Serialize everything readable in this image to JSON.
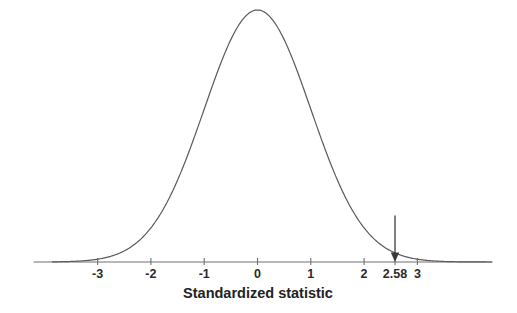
{
  "chart_data": {
    "type": "line",
    "title": "",
    "subtitle": "",
    "xlabel": "Standardized statistic",
    "ylabel": "",
    "xlim": [
      -3.85,
      4.4
    ],
    "ylim": [
      0,
      1.05
    ],
    "grid": false,
    "legend": null,
    "curve": {
      "name": "standard normal density",
      "distribution": "normal",
      "mean": 0,
      "sd": 1,
      "peak_x": 0,
      "peak_y": 1.0,
      "color": "#5a5a5a",
      "line_width": 1.2,
      "x": [
        -3.85,
        -3.5,
        -3.25,
        -3,
        -2.75,
        -2.5,
        -2.25,
        -2,
        -1.75,
        -1.5,
        -1.25,
        -1,
        -0.75,
        -0.5,
        -0.25,
        0,
        0.25,
        0.5,
        0.75,
        1,
        1.25,
        1.5,
        1.75,
        2,
        2.25,
        2.5,
        2.58,
        2.75,
        3,
        3.25,
        3.5,
        3.85,
        4.4
      ],
      "y": [
        0.0006,
        0.0022,
        0.0054,
        0.0111,
        0.0228,
        0.0439,
        0.0796,
        0.1353,
        0.2163,
        0.3247,
        0.4578,
        0.6065,
        0.7548,
        0.8825,
        0.9692,
        1.0,
        0.9692,
        0.8825,
        0.7548,
        0.6065,
        0.4578,
        0.3247,
        0.2163,
        0.1353,
        0.0796,
        0.0439,
        0.0356,
        0.0228,
        0.0111,
        0.0054,
        0.0022,
        0.0006,
        6e-05
      ]
    },
    "xticks": [
      {
        "value": -3,
        "label": "-3"
      },
      {
        "value": -2,
        "label": "-2"
      },
      {
        "value": -1,
        "label": "-1"
      },
      {
        "value": 0,
        "label": "0"
      },
      {
        "value": 1,
        "label": "1"
      },
      {
        "value": 2,
        "label": "2"
      },
      {
        "value": 2.58,
        "label": "2.58"
      },
      {
        "value": 3,
        "label": "3"
      }
    ],
    "annotations": [
      {
        "type": "arrow",
        "name": "test-statistic-arrow",
        "x": 2.58,
        "label": "2.58",
        "direction": "down",
        "y_from": 0.185,
        "y_to": 0.0,
        "color": "#3a3a3a"
      }
    ],
    "axis": {
      "color": "#707070",
      "line_width": 1.1,
      "x_start": -4.2,
      "x_end": 4.4,
      "baseline_y": 0
    }
  }
}
